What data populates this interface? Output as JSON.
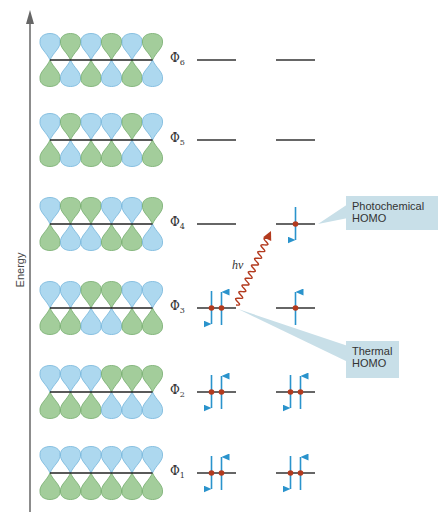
{
  "diagram": {
    "axis": {
      "label": "Energy"
    },
    "colors": {
      "blue_lobe": "#a9d6ef",
      "blue_lobe_edge": "#6fb3d9",
      "green_lobe": "#9fcb96",
      "green_lobe_edge": "#6fa867",
      "level_line": "#333333",
      "electron_arrow": "#2a93cc",
      "electron_dot": "#b33a1e",
      "photon": "#b33a1e",
      "callout_bg": "#c8dfe8"
    },
    "orbitals": [
      {
        "name": "Φ6",
        "symbol": "Φ",
        "sub": "6",
        "top_phases": [
          "B",
          "G",
          "B",
          "G",
          "B",
          "G"
        ],
        "ground_electrons": 0,
        "excited_electrons": 0
      },
      {
        "name": "Φ5",
        "symbol": "Φ",
        "sub": "5",
        "top_phases": [
          "B",
          "G",
          "B",
          "B",
          "G",
          "B"
        ],
        "ground_electrons": 0,
        "excited_electrons": 0
      },
      {
        "name": "Φ4",
        "symbol": "Φ",
        "sub": "4",
        "top_phases": [
          "B",
          "G",
          "G",
          "B",
          "B",
          "G"
        ],
        "ground_electrons": 0,
        "excited_electrons": 1
      },
      {
        "name": "Φ3",
        "symbol": "Φ",
        "sub": "3",
        "top_phases": [
          "B",
          "B",
          "G",
          "G",
          "B",
          "B"
        ],
        "ground_electrons": 2,
        "excited_electrons": 1
      },
      {
        "name": "Φ2",
        "symbol": "Φ",
        "sub": "2",
        "top_phases": [
          "B",
          "B",
          "B",
          "G",
          "G",
          "G"
        ],
        "ground_electrons": 2,
        "excited_electrons": 2
      },
      {
        "name": "Φ1",
        "symbol": "Φ",
        "sub": "1",
        "top_phases": [
          "B",
          "B",
          "B",
          "B",
          "B",
          "B"
        ],
        "ground_electrons": 2,
        "excited_electrons": 2
      }
    ],
    "photon_label": "hν",
    "callouts": {
      "photochemical": {
        "line1": "Photochemical",
        "line2": "HOMO"
      },
      "thermal": {
        "line1": "Thermal",
        "line2": "HOMO"
      }
    }
  }
}
